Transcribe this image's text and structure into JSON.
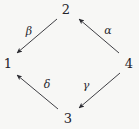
{
  "diagram": {
    "kind": "commutative-diagram",
    "background_color": "#f7f7f5",
    "stroke_color": "#2a2a30",
    "vertices": [
      {
        "id": "v2",
        "label": "2",
        "x": 66,
        "y": 9
      },
      {
        "id": "v1",
        "label": "1",
        "x": 8,
        "y": 63
      },
      {
        "id": "v4",
        "label": "4",
        "x": 129,
        "y": 63
      },
      {
        "id": "v3",
        "label": "3",
        "x": 68,
        "y": 118
      }
    ],
    "edges": [
      {
        "id": "alpha",
        "label": "α",
        "from": "4",
        "to": "2",
        "x1": 119,
        "y1": 53,
        "x2": 79,
        "y2": 19,
        "label_x": 108,
        "label_y": 30
      },
      {
        "id": "beta",
        "label": "β",
        "from": "2",
        "to": "1",
        "x1": 57,
        "y1": 19,
        "x2": 17,
        "y2": 53,
        "label_x": 29,
        "label_y": 31
      },
      {
        "id": "gamma",
        "label": "γ",
        "from": "4",
        "to": "3",
        "x1": 120,
        "y1": 73,
        "x2": 79,
        "y2": 108,
        "label_x": 86,
        "label_y": 85
      },
      {
        "id": "delta",
        "label": "δ",
        "from": "3",
        "to": "1",
        "x1": 58,
        "y1": 109,
        "x2": 17,
        "y2": 75,
        "label_x": 47,
        "label_y": 84
      }
    ]
  }
}
